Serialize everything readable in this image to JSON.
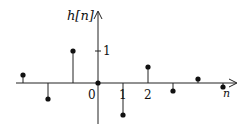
{
  "chart_data": {
    "type": "stem",
    "title": "",
    "ylabel": "h[n]",
    "xlabel": "n",
    "x": [
      -4,
      -3,
      -2,
      -1,
      0,
      1,
      2,
      3,
      4,
      5
    ],
    "values": [
      0.25,
      -0.5,
      1.0,
      0.0,
      0.0,
      -1.0,
      0.5,
      -0.25,
      0.125,
      -0.125
    ],
    "series": [
      {
        "n": -3,
        "value": 0.25
      },
      {
        "n": -2,
        "value": -0.5
      },
      {
        "n": -1,
        "value": 1.0
      },
      {
        "n": 0,
        "value": 0.0
      },
      {
        "n": 1,
        "value": -1.0
      },
      {
        "n": 2,
        "value": 0.5
      },
      {
        "n": 3,
        "value": -0.25
      },
      {
        "n": 4,
        "value": 0.125
      },
      {
        "n": 5,
        "value": -0.125
      }
    ],
    "x_tick_labels": [
      "0",
      "1",
      "2"
    ],
    "y_tick_labels": [
      "1"
    ],
    "grid": false,
    "legend": false
  },
  "labels": {
    "ylabel": "h[n]",
    "xlabel": "n",
    "origin": "0",
    "x1": "1",
    "x2": "2",
    "y1": "1"
  }
}
